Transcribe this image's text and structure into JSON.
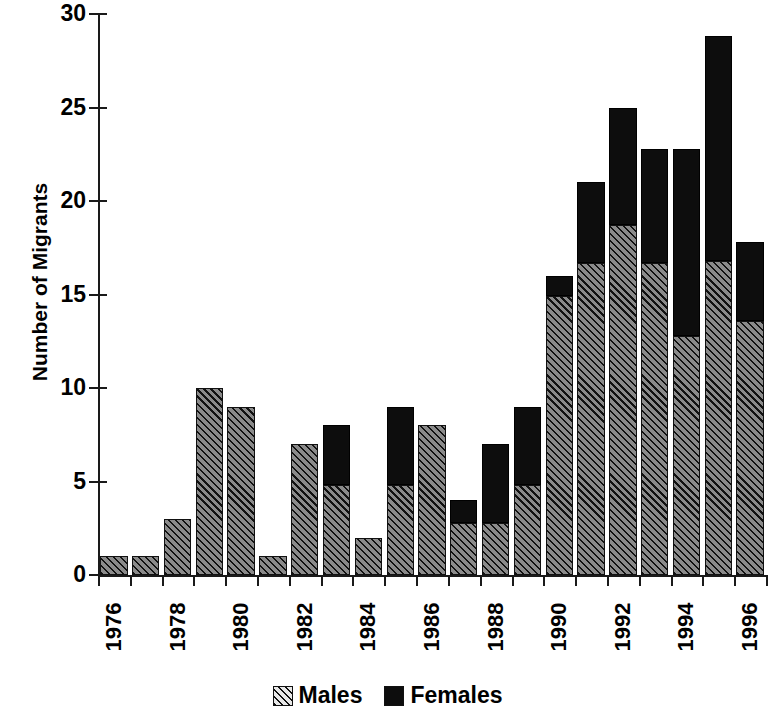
{
  "chart_data": {
    "type": "bar",
    "subtype": "stacked-vertical",
    "title": "",
    "xlabel": "",
    "ylabel": "Number of Migrants",
    "ylim": [
      0,
      30
    ],
    "yticks": [
      0,
      5,
      10,
      15,
      20,
      25,
      30
    ],
    "ytick_labels": [
      "0",
      "5",
      "10",
      "15",
      "20",
      "25",
      "30"
    ],
    "grid": false,
    "legend_position": "bottom-center",
    "categories": [
      "1976",
      "1977",
      "1978",
      "1979",
      "1980",
      "1981",
      "1982",
      "1983",
      "1984",
      "1985",
      "1986",
      "1987",
      "1988",
      "1989",
      "1990",
      "1991",
      "1992",
      "1993",
      "1994",
      "1995",
      "1996"
    ],
    "xtick_labels_shown": [
      "1976",
      "1978",
      "1980",
      "1982",
      "1984",
      "1986",
      "1988",
      "1990",
      "1992",
      "1994",
      "1996"
    ],
    "series": [
      {
        "name": "Males",
        "color": "#6e6e6e",
        "pattern": "diagonal-hatch",
        "values": [
          1,
          1,
          3,
          10,
          9,
          1,
          7,
          4.8,
          2,
          4.8,
          8,
          2.8,
          2.8,
          4.8,
          14.9,
          16.7,
          18.7,
          16.7,
          12.8,
          16.8,
          13.6
        ]
      },
      {
        "name": "Females",
        "color": "#0d0d0d",
        "pattern": "solid",
        "values": [
          0,
          0,
          0,
          0,
          0,
          0,
          0,
          3.2,
          0,
          4.2,
          0,
          1.2,
          4.2,
          4.2,
          1.1,
          4.3,
          6.3,
          6.1,
          10.0,
          12.0,
          4.2
        ]
      }
    ],
    "totals": [
      1,
      1,
      3,
      10,
      9,
      1,
      7,
      8,
      2,
      9,
      8,
      4,
      7,
      9,
      16,
      21,
      25,
      22.8,
      22.8,
      28.8,
      17.8
    ]
  },
  "legend": {
    "items": [
      {
        "label": "Males",
        "swatch": "hatched-gray"
      },
      {
        "label": "Females",
        "swatch": "solid-black"
      }
    ]
  }
}
